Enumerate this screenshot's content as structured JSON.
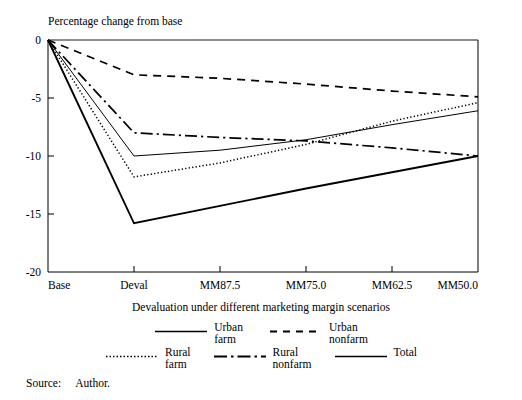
{
  "figure": {
    "y_axis_caption": "Percentage change from base",
    "source_label": "Source:",
    "source_value": "Author."
  },
  "chart_data": {
    "type": "line",
    "title": "",
    "xlabel": "Devaluation under different marketing margin scenarios",
    "ylabel": "Percentage change from base",
    "categories": [
      "Base",
      "Deval",
      "MM87.5",
      "MM75.0",
      "MM62.5",
      "MM50.0"
    ],
    "yticks": [
      "0",
      "-5",
      "-10",
      "-15",
      "-20"
    ],
    "ytick_values": [
      0,
      -5,
      -10,
      -15,
      -20
    ],
    "ylim": [
      -20,
      0
    ],
    "grid": false,
    "legend_position": "below-axis",
    "series": [
      {
        "name": "Urban farm",
        "label_line1": "Urban",
        "label_line2": "farm",
        "style": "solid-thin",
        "color": "#000000",
        "values": [
          0,
          -10.0,
          -9.5,
          -8.6,
          -7.3,
          -6.1
        ]
      },
      {
        "name": "Urban nonfarm",
        "label_line1": "Urban",
        "label_line2": "nonfarm",
        "style": "dashed",
        "color": "#000000",
        "values": [
          0,
          -3.0,
          -3.3,
          -3.8,
          -4.4,
          -4.9
        ]
      },
      {
        "name": "Rural farm",
        "label_line1": "Rural",
        "label_line2": "farm",
        "style": "dotted",
        "color": "#000000",
        "values": [
          0,
          -11.8,
          -10.6,
          -9.0,
          -7.0,
          -5.4
        ]
      },
      {
        "name": "Rural nonfarm",
        "label_line1": "Rural",
        "label_line2": "nonfarm",
        "style": "dash-dot",
        "color": "#000000",
        "values": [
          0,
          -8.0,
          -8.4,
          -8.7,
          -9.3,
          -10.0
        ]
      },
      {
        "name": "Total",
        "label_line1": "Total",
        "label_line2": "",
        "style": "solid-thick",
        "color": "#000000",
        "values": [
          0,
          -15.8,
          -14.3,
          -12.8,
          -11.4,
          -10.0
        ]
      }
    ]
  }
}
